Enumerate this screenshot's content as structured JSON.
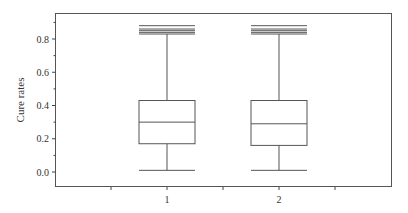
{
  "chart_data": {
    "type": "boxplot",
    "title": "",
    "xlabel": "",
    "ylabel": "Cure rates",
    "ylim": [
      -0.09,
      0.95
    ],
    "yticks": [
      "0.0",
      "0.2",
      "0.4",
      "0.6",
      "0.8"
    ],
    "ytick_values": [
      0.0,
      0.2,
      0.4,
      0.6,
      0.8
    ],
    "categories": [
      "1",
      "2"
    ],
    "grid": false,
    "legend": null,
    "series": [
      {
        "name": "1",
        "min": 0.01,
        "q1": 0.17,
        "median": 0.3,
        "q3": 0.43,
        "max": 0.83,
        "outliers": [
          0.84,
          0.85,
          0.86,
          0.88
        ]
      },
      {
        "name": "2",
        "min": 0.01,
        "q1": 0.16,
        "median": 0.29,
        "q3": 0.43,
        "max": 0.83,
        "outliers": [
          0.84,
          0.85,
          0.86,
          0.88
        ]
      }
    ]
  },
  "colors": {
    "axis": "#444444",
    "box": "#555555",
    "text": "#333333"
  }
}
